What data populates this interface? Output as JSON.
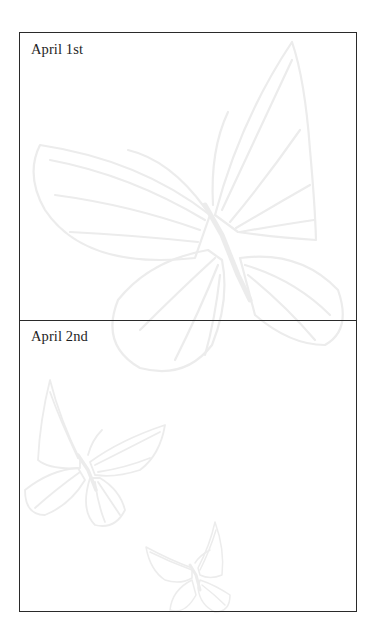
{
  "entries": [
    {
      "label": "April 1st"
    },
    {
      "label": "April 2nd"
    }
  ],
  "decoration": {
    "watermark": "butterflies",
    "line_color": "#ececec",
    "border_color": "#2a2a2a"
  }
}
